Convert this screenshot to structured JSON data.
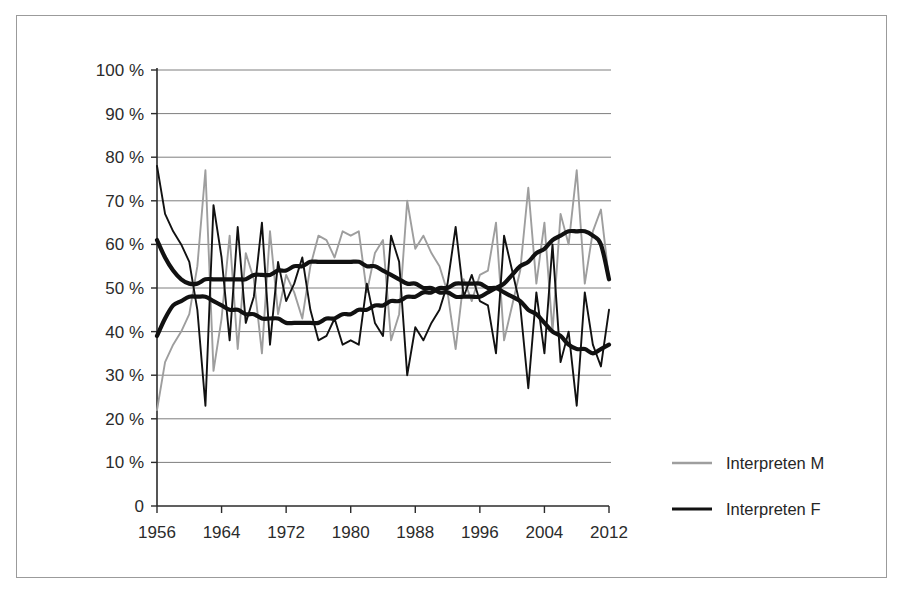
{
  "chart_data": {
    "type": "line",
    "title": "",
    "xlabel": "",
    "ylabel": "",
    "xlim": [
      1956,
      2012
    ],
    "ylim": [
      0,
      100
    ],
    "grid": true,
    "legend_position": "right",
    "y_ticks": [
      0,
      10,
      20,
      30,
      40,
      50,
      60,
      70,
      80,
      90,
      100
    ],
    "y_tick_labels": [
      "0",
      "10 %",
      "20 %",
      "30 %",
      "40 %",
      "50 %",
      "60 %",
      "70 %",
      "80 %",
      "90 %",
      "100 %"
    ],
    "x_ticks": [
      1956,
      1964,
      1972,
      1980,
      1988,
      1996,
      2004,
      2012
    ],
    "x_tick_labels": [
      "1956",
      "1964",
      "1972",
      "1980",
      "1988",
      "1996",
      "2004",
      "2012"
    ],
    "x": [
      1956,
      1957,
      1958,
      1959,
      1960,
      1961,
      1962,
      1963,
      1964,
      1965,
      1966,
      1967,
      1968,
      1969,
      1970,
      1971,
      1972,
      1973,
      1974,
      1975,
      1976,
      1977,
      1978,
      1979,
      1980,
      1981,
      1982,
      1983,
      1984,
      1985,
      1986,
      1987,
      1988,
      1989,
      1990,
      1991,
      1992,
      1993,
      1994,
      1995,
      1996,
      1997,
      1998,
      1999,
      2000,
      2001,
      2002,
      2003,
      2004,
      2005,
      2006,
      2007,
      2008,
      2009,
      2010,
      2011,
      2012
    ],
    "series": [
      {
        "name": "Interpreten M",
        "color": "#9e9e9e",
        "style": "thin-line",
        "values": [
          22,
          33,
          37,
          40,
          44,
          55,
          77,
          31,
          43,
          62,
          36,
          58,
          52,
          35,
          63,
          44,
          53,
          49,
          43,
          55,
          62,
          61,
          57,
          63,
          62,
          63,
          49,
          58,
          61,
          38,
          44,
          70,
          59,
          62,
          58,
          55,
          49,
          36,
          52,
          47,
          53,
          54,
          65,
          38,
          46,
          54,
          73,
          51,
          65,
          40,
          67,
          60,
          77,
          51,
          63,
          68,
          52
        ]
      },
      {
        "name": "Interpreten F",
        "color": "#111111",
        "style": "thin-line",
        "values": [
          78,
          67,
          63,
          60,
          56,
          45,
          23,
          69,
          57,
          38,
          64,
          42,
          48,
          65,
          37,
          56,
          47,
          51,
          57,
          45,
          38,
          39,
          43,
          37,
          38,
          37,
          51,
          42,
          39,
          62,
          56,
          30,
          41,
          38,
          42,
          45,
          51,
          64,
          48,
          53,
          47,
          46,
          35,
          62,
          54,
          46,
          27,
          49,
          35,
          60,
          33,
          40,
          23,
          49,
          37,
          32,
          45
        ]
      },
      {
        "name": "Interpreten M Trend",
        "color": "#111111",
        "style": "thick-smooth",
        "values": [
          39,
          43,
          46,
          47,
          48,
          48,
          48,
          47,
          46,
          45,
          45,
          44,
          44,
          43,
          43,
          43,
          42,
          42,
          42,
          42,
          42,
          43,
          43,
          44,
          44,
          45,
          45,
          46,
          46,
          47,
          47,
          48,
          48,
          49,
          49,
          50,
          50,
          51,
          51,
          51,
          51,
          50,
          50,
          49,
          48,
          47,
          45,
          44,
          42,
          40,
          39,
          37,
          36,
          36,
          35,
          36,
          37
        ]
      },
      {
        "name": "Interpreten F Trend",
        "color": "#111111",
        "style": "thick-smooth",
        "values": [
          61,
          57,
          54,
          52,
          51,
          51,
          52,
          52,
          52,
          52,
          52,
          52,
          53,
          53,
          53,
          54,
          54,
          55,
          55,
          56,
          56,
          56,
          56,
          56,
          56,
          56,
          55,
          55,
          54,
          53,
          52,
          51,
          51,
          50,
          50,
          49,
          49,
          48,
          48,
          48,
          48,
          49,
          50,
          51,
          53,
          55,
          56,
          58,
          59,
          61,
          62,
          63,
          63,
          63,
          62,
          60,
          52
        ]
      }
    ],
    "legend": [
      {
        "label": "Interpreten M",
        "color": "#9e9e9e",
        "width": "thin"
      },
      {
        "label": "Interpreten F",
        "color": "#111111",
        "width": "thick"
      }
    ]
  },
  "figure": {
    "border_color": "#9b9b9b",
    "background": "#ffffff"
  }
}
